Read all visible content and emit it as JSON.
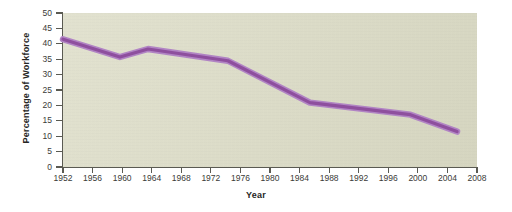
{
  "chart_data": {
    "type": "line",
    "title": "",
    "xlabel": "Year",
    "ylabel": "Percentage of Workforce",
    "xlim": [
      1952,
      2008
    ],
    "ylim": [
      0,
      50
    ],
    "grid": false,
    "legend": "none",
    "xticks": [
      1952,
      1956,
      1960,
      1964,
      1968,
      1972,
      1976,
      1980,
      1984,
      1988,
      1992,
      1996,
      2000,
      2004,
      2008
    ],
    "yticks": [
      0,
      5,
      10,
      15,
      20,
      25,
      30,
      35,
      40,
      45,
      50
    ],
    "series": [
      {
        "name": "Percentage of Workforce",
        "color": "#8e4f9e",
        "points": [
          {
            "x": 1952.0,
            "y": 41.5
          },
          {
            "x": 1959.7,
            "y": 35.7
          },
          {
            "x": 1963.5,
            "y": 38.3
          },
          {
            "x": 1974.3,
            "y": 34.5
          },
          {
            "x": 1985.4,
            "y": 20.9
          },
          {
            "x": 1999.0,
            "y": 17.0
          },
          {
            "x": 2005.3,
            "y": 11.5
          }
        ]
      }
    ]
  },
  "figure": {
    "line_color": "#8e4f9e",
    "line_highlight_color": "#b184c4",
    "panel_background": "#dcdcc6",
    "axis_color": "#5a5a52",
    "text_color": "#262624"
  }
}
